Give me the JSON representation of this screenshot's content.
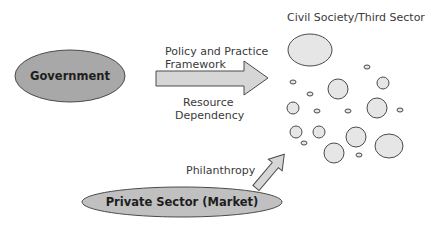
{
  "diagram": {
    "nodes": {
      "government": {
        "label": "Government",
        "fill": "#a8a8a8"
      },
      "private_sector": {
        "label": "Private Sector (Market)",
        "fill": "#c0c0c0"
      },
      "civil_society": {
        "label": "Civil Society/Third Sector",
        "fill": "#e6e6e6"
      }
    },
    "edges": {
      "government_to_civil": {
        "label_top_line1": "Policy and Practice",
        "label_top_line2": "Framework",
        "label_bottom_line1": "Resource",
        "label_bottom_line2": "Dependency"
      },
      "private_to_civil": {
        "label": "Philanthropy"
      }
    },
    "colors": {
      "stroke": "#4a4a4a",
      "arrow_fill": "#d6d6d6",
      "bubble_fill": "#e6e6e6"
    }
  }
}
